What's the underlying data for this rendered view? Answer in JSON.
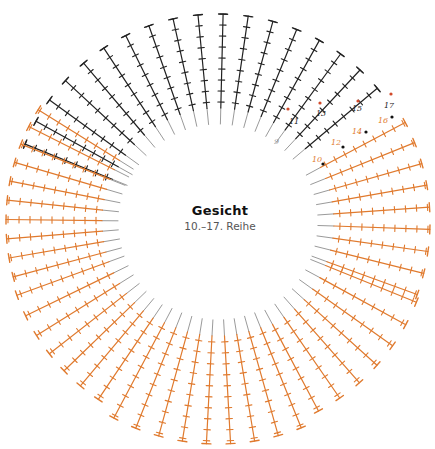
{
  "diagram": {
    "title": "Gesicht",
    "subtitle": "10.–17. Reihe",
    "center": [
      218,
      222
    ],
    "inner_radius": 95,
    "outer_radius": 215,
    "colors": {
      "black": "#222222",
      "orange": "#e07a2e",
      "gray": "#9a9a9a",
      "dot_red": "#d24a2a",
      "dot_black": "#111111"
    },
    "segments": [
      {
        "name": "top-arc",
        "color": "black",
        "start_deg": -158,
        "end_deg": -40,
        "spokes": 18,
        "inner_r": 98,
        "outer_r": 208
      },
      {
        "name": "right-upper",
        "color": "orange",
        "start_deg": -28,
        "end_deg": 20,
        "spokes": 9,
        "inner_r": 100,
        "outer_r": 212
      },
      {
        "name": "right-lower",
        "color": "orange",
        "start_deg": 22,
        "end_deg": 62,
        "spokes": 7,
        "inner_r": 100,
        "outer_r": 214
      },
      {
        "name": "bottom",
        "color": "orange",
        "start_deg": 68,
        "end_deg": 118,
        "spokes": 9,
        "inner_r": 98,
        "outer_r": 222
      },
      {
        "name": "left-lower",
        "color": "orange",
        "start_deg": 124,
        "end_deg": 160,
        "spokes": 7,
        "inner_r": 100,
        "outer_r": 214
      },
      {
        "name": "left-upper",
        "color": "orange",
        "start_deg": 165,
        "end_deg": 212,
        "spokes": 10,
        "inner_r": 100,
        "outer_r": 212
      }
    ],
    "row_labels": [
      {
        "text": "11",
        "x": 289,
        "y": 124,
        "color": "black"
      },
      {
        "text": "13",
        "x": 316,
        "y": 116,
        "color": "black"
      },
      {
        "text": "15",
        "x": 352,
        "y": 111,
        "color": "black"
      },
      {
        "text": "17",
        "x": 384,
        "y": 108,
        "color": "black"
      },
      {
        "text": "9",
        "x": 274,
        "y": 144,
        "color": "gray"
      },
      {
        "text": "10",
        "x": 312,
        "y": 162,
        "color": "orange"
      },
      {
        "text": "12",
        "x": 331,
        "y": 145,
        "color": "orange"
      },
      {
        "text": "14",
        "x": 352,
        "y": 134,
        "color": "orange"
      },
      {
        "text": "16",
        "x": 378,
        "y": 123,
        "color": "orange"
      }
    ],
    "markers": [
      {
        "x": 288,
        "y": 109,
        "color": "dot_red"
      },
      {
        "x": 320,
        "y": 103,
        "color": "dot_red"
      },
      {
        "x": 358,
        "y": 101,
        "color": "dot_red"
      },
      {
        "x": 391,
        "y": 94,
        "color": "dot_red"
      },
      {
        "x": 323,
        "y": 164,
        "color": "dot_black"
      },
      {
        "x": 343,
        "y": 147,
        "color": "dot_black"
      },
      {
        "x": 366,
        "y": 132,
        "color": "dot_black"
      },
      {
        "x": 392,
        "y": 117,
        "color": "dot_black"
      }
    ]
  }
}
